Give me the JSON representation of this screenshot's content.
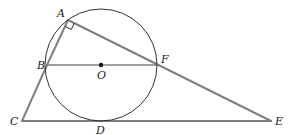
{
  "diagram": {
    "type": "geometry",
    "colors": {
      "circle": "#333333",
      "segment": "#808080",
      "point": "#111111",
      "label": "#222222"
    },
    "circle": {
      "center": "O",
      "cx": 101,
      "cy": 65,
      "r": 56
    },
    "points": {
      "A": {
        "label": "A",
        "x": 68,
        "y": 20,
        "lx": 57,
        "ly": 17
      },
      "B": {
        "label": "B",
        "x": 47,
        "y": 65,
        "lx": 37,
        "ly": 69
      },
      "O": {
        "label": "O",
        "x": 101,
        "y": 65,
        "lx": 97,
        "ly": 79
      },
      "F": {
        "label": "F",
        "x": 156,
        "y": 65,
        "lx": 161,
        "ly": 63
      },
      "C": {
        "label": "C",
        "x": 22,
        "y": 121,
        "lx": 10,
        "ly": 125
      },
      "D": {
        "label": "D",
        "x": 101,
        "y": 121,
        "lx": 96,
        "ly": 134
      },
      "E": {
        "label": "E",
        "x": 271,
        "y": 121,
        "lx": 275,
        "ly": 125
      }
    },
    "segments": [
      [
        "A",
        "B"
      ],
      [
        "B",
        "C"
      ],
      [
        "C",
        "E"
      ],
      [
        "A",
        "E"
      ],
      [
        "B",
        "F"
      ]
    ],
    "right_angle_marker": {
      "at": "A"
    }
  }
}
